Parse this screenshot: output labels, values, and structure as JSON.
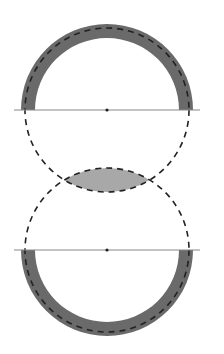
{
  "figure": {
    "colors": {
      "background": "#ffffff",
      "band": "#6a6a6a",
      "lens": "#a8a8a8",
      "dash": "#222222",
      "line": "#888888",
      "center_dot": "#222222"
    },
    "top_circle": {
      "cx": 107,
      "cy": 110,
      "outer_r": 86,
      "inner_r": 72,
      "dashed_r": 82,
      "shaded_half": "upper"
    },
    "bottom_circle": {
      "cx": 107,
      "cy": 250,
      "outer_r": 86,
      "inner_r": 72,
      "dashed_r": 82,
      "shaded_half": "lower"
    },
    "lines": [
      {
        "x1": 14,
        "x2": 200,
        "y": 110
      },
      {
        "x1": 14,
        "x2": 200,
        "y": 250
      }
    ]
  }
}
